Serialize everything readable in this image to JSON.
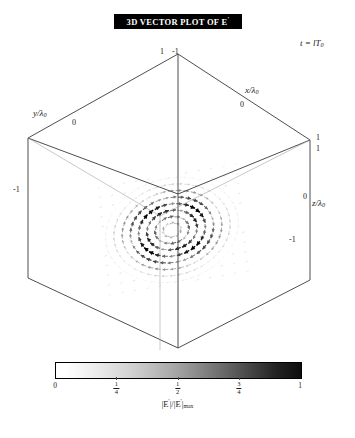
{
  "figure": {
    "title": "3D VECTOR PLOT OF E",
    "title_superscript": "'",
    "time_annotation": {
      "variable": "t",
      "equals": " = ",
      "value": "lT",
      "subscript": "0"
    }
  },
  "axes": {
    "x": {
      "label": "x/λ",
      "sub": "0",
      "ticks": [
        "1",
        "0",
        "-1"
      ]
    },
    "y": {
      "label": "y/λ",
      "sub": "0",
      "ticks": [
        "1",
        "0",
        "-1"
      ]
    },
    "z": {
      "label": "z/λ",
      "sub": "0",
      "ticks": [
        "1",
        "0",
        "-1"
      ]
    }
  },
  "tick_labels": {
    "top_left": "1",
    "top_right": "-1",
    "x_zero": "0",
    "y_zero": "0",
    "left_minus_one": "-1",
    "right_upper_one": "1",
    "right_lower_one": "1",
    "z_zero": "0",
    "bottom_minus_one": "-1"
  },
  "colorbar": {
    "caption_num": "|E",
    "caption_prime": "'",
    "caption_mid": "|/|E",
    "caption_den_sub": "max",
    "min_color": "#ffffff",
    "max_color": "#000000",
    "ticks": [
      {
        "value": 0,
        "label": "0",
        "type": "plain"
      },
      {
        "value": 0.25,
        "num": "1",
        "den": "4",
        "type": "fraction"
      },
      {
        "value": 0.5,
        "num": "1",
        "den": "2",
        "type": "fraction"
      },
      {
        "value": 0.75,
        "num": "3",
        "den": "4",
        "type": "fraction"
      },
      {
        "value": 1,
        "label": "1",
        "type": "plain"
      }
    ]
  },
  "chart_data": {
    "type": "scatter",
    "title": "3D VECTOR PLOT OF E'",
    "subtitle": "t = lT0",
    "xlabel": "x/λ0",
    "ylabel": "y/λ0",
    "zlabel": "z/λ0",
    "xlim": [
      -1,
      1
    ],
    "ylim": [
      -1,
      1
    ],
    "zlim": [
      -1,
      1
    ],
    "grid": false,
    "legend": "none",
    "colormap": "grayscale_white_to_black",
    "colorbar_label": "|E'|/|E'|max",
    "colorbar_range": [
      0,
      1
    ],
    "colorbar_ticks": [
      0,
      0.25,
      0.5,
      0.75,
      1
    ],
    "rings": [
      {
        "radius": 0.12,
        "amplitude": 0.35,
        "arrows": 10
      },
      {
        "radius": 0.24,
        "amplitude": 0.62,
        "arrows": 16
      },
      {
        "radius": 0.36,
        "amplitude": 0.88,
        "arrows": 22
      },
      {
        "radius": 0.48,
        "amplitude": 1.0,
        "arrows": 28
      },
      {
        "radius": 0.6,
        "amplitude": 0.74,
        "arrows": 34
      },
      {
        "radius": 0.72,
        "amplitude": 0.42,
        "arrows": 40
      },
      {
        "radius": 0.84,
        "amplitude": 0.2,
        "arrows": 46
      },
      {
        "radius": 0.96,
        "amplitude": 0.08,
        "arrows": 52
      }
    ]
  }
}
